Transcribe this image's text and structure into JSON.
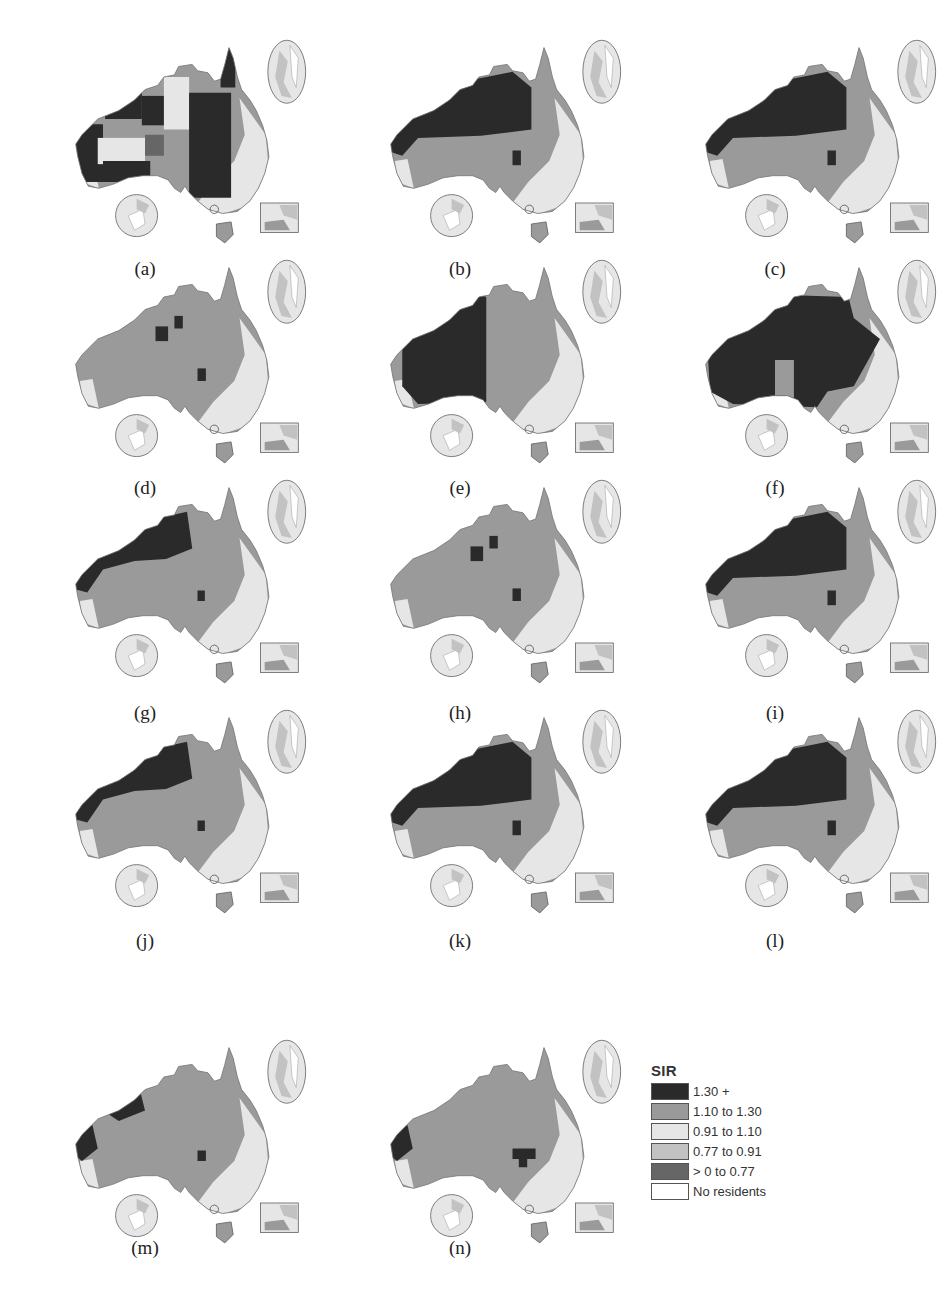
{
  "figure": {
    "legend": {
      "title": "SIR",
      "items": [
        {
          "label": "1.30 +",
          "color": "#2a2a2a"
        },
        {
          "label": "1.10 to 1.30",
          "color": "#9a9a9a"
        },
        {
          "label": "0.91 to 1.10",
          "color": "#e6e6e6"
        },
        {
          "label": "0.77 to 0.91",
          "color": "#c2c2c2"
        },
        {
          "label": "> 0 to 0.77",
          "color": "#666666"
        },
        {
          "label": "No residents",
          "color": "#ffffff"
        }
      ]
    },
    "panels": [
      {
        "label": "(a)",
        "pattern": "mixed"
      },
      {
        "label": "(b)",
        "pattern": "north-dark"
      },
      {
        "label": "(c)",
        "pattern": "north-dark"
      },
      {
        "label": "(d)",
        "pattern": "mostly-mid"
      },
      {
        "label": "(e)",
        "pattern": "west-dark"
      },
      {
        "label": "(f)",
        "pattern": "centre-dark"
      },
      {
        "label": "(g)",
        "pattern": "northwest-dark"
      },
      {
        "label": "(h)",
        "pattern": "mostly-mid"
      },
      {
        "label": "(i)",
        "pattern": "north-dark"
      },
      {
        "label": "(j)",
        "pattern": "northwest-dark"
      },
      {
        "label": "(k)",
        "pattern": "north-dark"
      },
      {
        "label": "(l)",
        "pattern": "north-dark"
      },
      {
        "label": "(m)",
        "pattern": "west-coast-dark"
      },
      {
        "label": "(n)",
        "pattern": "west-coast-dark-ne"
      }
    ]
  },
  "chart_data": {
    "type": "choropleth-map-small-multiples",
    "title": "",
    "legend_title": "SIR",
    "legend_position": "bottom-right",
    "classes": [
      "1.30 +",
      "1.10 to 1.30",
      "0.91 to 1.10",
      "0.77 to 0.91",
      "> 0 to 0.77",
      "No residents"
    ],
    "panels": [
      "(a)",
      "(b)",
      "(c)",
      "(d)",
      "(e)",
      "(f)",
      "(g)",
      "(h)",
      "(i)",
      "(j)",
      "(k)",
      "(l)",
      "(m)",
      "(n)"
    ],
    "region": "Australia",
    "insets_per_panel": [
      "upper-right ellipse",
      "lower-left circle",
      "lower-right rectangle"
    ]
  }
}
